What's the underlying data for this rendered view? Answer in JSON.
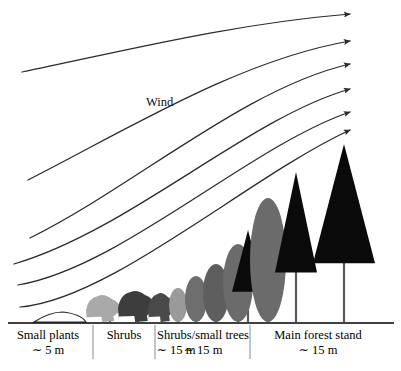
{
  "figure": {
    "background_color": "#ffffff",
    "width": 401,
    "height": 371
  },
  "annotations": {
    "wind_label": "Wind",
    "wind_label_x": 146,
    "wind_label_y": 95
  },
  "axis": {
    "baseline_y": 323,
    "baseline_x_start": 8,
    "baseline_x_end": 394,
    "line_color": "#000000",
    "divider_color": "#8a8a8a",
    "dividers": [
      93,
      155,
      250
    ]
  },
  "zones": [
    {
      "id": "small-plants",
      "name": "Small plants",
      "distance": "∼ 5 m",
      "center_x": 48,
      "x_start": 8,
      "x_end": 93
    },
    {
      "id": "shrubs",
      "name": "Shrubs",
      "distance": "",
      "center_x": 124,
      "x_start": 93,
      "x_end": 155
    },
    {
      "id": "shrubs-small-trees",
      "name": "Shrubs/small trees",
      "distance": "∼ 15 m",
      "center_x": 203,
      "x_start": 155,
      "x_end": 250
    },
    {
      "id": "main-forest-stand",
      "name": "Main forest stand",
      "distance": "∼ 15 m",
      "center_x": 318,
      "x_start": 250,
      "x_end": 394
    }
  ],
  "shared_distance_label": {
    "text": "∼ 15 m",
    "center_x": 176
  },
  "colors": {
    "stroke": "#2a2a2a",
    "black_tree": "#0a0a0a",
    "gray_light": "#a9a9a9",
    "gray_mid": "#7d7d7d",
    "gray_dark": "#3d3d3d",
    "trunk": "#5a5a5a",
    "ground": "#000000"
  },
  "chart_data": {
    "type": "line",
    "xlabel": "",
    "ylabel": "",
    "grid": false,
    "legend": null,
    "streamlines": [
      {
        "name": "streamline-1-top",
        "has_arrow": true,
        "start": [
          22,
          72
        ],
        "end": [
          350,
          14
        ],
        "control_points": [
          [
            120,
            52
          ],
          [
            230,
            24
          ]
        ]
      },
      {
        "name": "streamline-2",
        "has_arrow": true,
        "start": [
          28,
          180
        ],
        "end": [
          350,
          41
        ],
        "control_points": [
          [
            130,
            128
          ],
          [
            240,
            60
          ]
        ]
      },
      {
        "name": "streamline-3",
        "has_arrow": true,
        "start": [
          30,
          238
        ],
        "end": [
          350,
          64
        ],
        "control_points": [
          [
            135,
            186
          ],
          [
            245,
            88
          ]
        ]
      },
      {
        "name": "streamline-4",
        "has_arrow": true,
        "start": [
          14,
          264
        ],
        "end": [
          350,
          89
        ],
        "control_points": [
          [
            130,
            230
          ],
          [
            248,
            118
          ]
        ]
      },
      {
        "name": "streamline-5",
        "has_arrow": true,
        "start": [
          18,
          285
        ],
        "end": [
          350,
          112
        ],
        "control_points": [
          [
            120,
            268
          ],
          [
            250,
            146
          ]
        ]
      },
      {
        "name": "streamline-6-lowest",
        "has_arrow": true,
        "start": [
          20,
          307
        ],
        "end": [
          350,
          130
        ],
        "control_points": [
          [
            110,
            300
          ],
          [
            250,
            176
          ]
        ]
      }
    ],
    "vegetation": [
      {
        "name": "small-plant-mound",
        "shape": "mound",
        "zone": "small-plants",
        "x": 60,
        "base_y": 322,
        "width": 52,
        "height": 10,
        "fill": "none"
      },
      {
        "name": "shrub-1",
        "shape": "blob",
        "zone": "shrubs",
        "x": 104,
        "base_y": 322,
        "width": 34,
        "height": 26,
        "fill": "#a9a9a9"
      },
      {
        "name": "shrub-2",
        "shape": "blob",
        "zone": "shrubs",
        "x": 137,
        "base_y": 322,
        "width": 36,
        "height": 30,
        "fill": "#3d3d3d"
      },
      {
        "name": "shrub-3",
        "shape": "blob",
        "zone": "shrubs-small-trees",
        "x": 162,
        "base_y": 322,
        "width": 26,
        "height": 28,
        "fill": "#4a4a4a"
      },
      {
        "name": "shrub-4",
        "shape": "oval",
        "zone": "shrubs-small-trees",
        "x": 178,
        "base_y": 322,
        "width": 18,
        "height": 34,
        "fill": "#9a9a9a"
      },
      {
        "name": "shrub-5",
        "shape": "oval",
        "zone": "shrubs-small-trees",
        "x": 196,
        "base_y": 322,
        "width": 22,
        "height": 46,
        "fill": "#6e6e6e"
      },
      {
        "name": "shrub-6",
        "shape": "oval",
        "zone": "shrubs-small-trees",
        "x": 216,
        "base_y": 322,
        "width": 26,
        "height": 58,
        "fill": "#5e5e5e"
      },
      {
        "name": "shrub-7",
        "shape": "oval",
        "zone": "shrubs-small-trees",
        "x": 238,
        "base_y": 322,
        "width": 30,
        "height": 78,
        "fill": "#6b6b6b"
      },
      {
        "name": "conifer-small",
        "shape": "triangle",
        "zone": "main-forest-stand",
        "x": 248,
        "base_y": 322,
        "width": 32,
        "height": 92,
        "fill": "#0a0a0a"
      },
      {
        "name": "broadleaf-large",
        "shape": "oval",
        "zone": "main-forest-stand",
        "x": 268,
        "base_y": 322,
        "width": 36,
        "height": 124,
        "fill": "#6b6b6b"
      },
      {
        "name": "conifer-mid",
        "shape": "triangle",
        "zone": "main-forest-stand",
        "x": 296,
        "base_y": 322,
        "width": 42,
        "height": 150,
        "fill": "#0a0a0a"
      },
      {
        "name": "conifer-tall",
        "shape": "triangle",
        "zone": "main-forest-stand",
        "x": 344,
        "base_y": 322,
        "width": 62,
        "height": 178,
        "fill": "#0a0a0a"
      }
    ],
    "trunks": [
      {
        "name": "trunk-1",
        "x": 110,
        "top_y": 300,
        "bottom_y": 322
      },
      {
        "name": "trunk-2",
        "x": 138,
        "top_y": 300,
        "bottom_y": 322
      },
      {
        "name": "trunk-3",
        "x": 162,
        "top_y": 302,
        "bottom_y": 322
      },
      {
        "name": "trunk-4",
        "x": 178,
        "top_y": 300,
        "bottom_y": 322
      },
      {
        "name": "trunk-5",
        "x": 196,
        "top_y": 295,
        "bottom_y": 322
      },
      {
        "name": "trunk-6",
        "x": 216,
        "top_y": 290,
        "bottom_y": 322
      },
      {
        "name": "trunk-7",
        "x": 238,
        "top_y": 280,
        "bottom_y": 322
      },
      {
        "name": "trunk-8",
        "x": 248,
        "top_y": 280,
        "bottom_y": 322
      },
      {
        "name": "trunk-9",
        "x": 268,
        "top_y": 265,
        "bottom_y": 322
      },
      {
        "name": "trunk-10",
        "x": 296,
        "top_y": 248,
        "bottom_y": 322
      },
      {
        "name": "trunk-11",
        "x": 344,
        "top_y": 242,
        "bottom_y": 322
      }
    ]
  }
}
